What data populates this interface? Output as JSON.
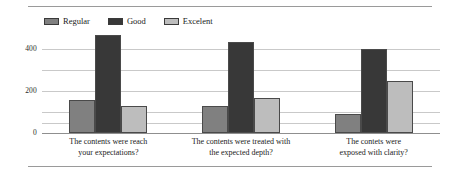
{
  "chart_data": {
    "type": "bar",
    "title": "",
    "xlabel": "",
    "ylabel": "",
    "ylim": [
      0,
      500
    ],
    "yticks": [
      0,
      200,
      400
    ],
    "ytick_labels": [
      "0",
      "200",
      "400"
    ],
    "grid": true,
    "legend_position": "top",
    "categories": [
      "The contents were reach your expectations?",
      "The contents were treated with the expected depth?",
      "The contets were exposed with clarity?"
    ],
    "category_lines": [
      [
        "The contents were reach",
        "your expectations?"
      ],
      [
        "The contents were treated with",
        "the expected depth?"
      ],
      [
        "The contets were",
        "exposed with clarity?"
      ]
    ],
    "series": [
      {
        "name": "Regular",
        "color": "#808080",
        "values": [
          155,
          130,
          90
        ]
      },
      {
        "name": "Good",
        "color": "#383838",
        "values": [
          465,
          435,
          400
        ]
      },
      {
        "name": "Excelent",
        "color": "#bdbdbd",
        "values": [
          130,
          165,
          250
        ]
      }
    ]
  },
  "legend": {
    "items": [
      {
        "label": "Regular"
      },
      {
        "label": "Good"
      },
      {
        "label": "Excelent"
      }
    ]
  },
  "axis": {
    "y": {
      "tick_400": "400",
      "tick_200": "200",
      "tick_0": "0"
    }
  },
  "xaxis": {
    "labels": [
      {
        "line1": "The contents were reach",
        "line2": "your expectations?"
      },
      {
        "line1": "The contents were treated with",
        "line2": "the expected depth?"
      },
      {
        "line1": "The contets were",
        "line2": "exposed with clarity?"
      }
    ]
  }
}
